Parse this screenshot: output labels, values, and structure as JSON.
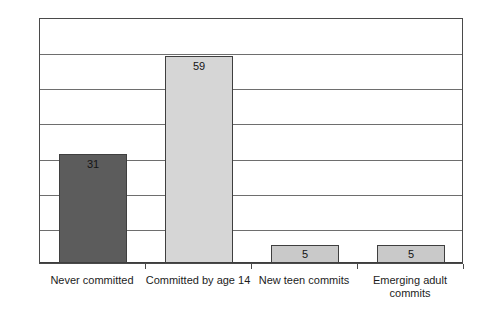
{
  "chart_data": {
    "type": "bar",
    "title": "",
    "subtitle": "",
    "xlabel": "",
    "ylabel": "",
    "categories": [
      "Never committed",
      "Committed by age 14",
      "New teen commits",
      "Emerging adult commits"
    ],
    "values": [
      31,
      59,
      5,
      5
    ],
    "data_labels": [
      "31",
      "59",
      "5",
      "5"
    ],
    "ylim": [
      0,
      70
    ],
    "ytick_step": 10,
    "ytick_labels": [
      "0",
      "10",
      "20",
      "30",
      "40",
      "50",
      "60",
      "70"
    ],
    "grid": true,
    "legend": "none",
    "bar_colors": [
      "#5c5c5c",
      "#d6d6d6",
      "#c9c9c9",
      "#c9c9c9"
    ],
    "bar_border_color": "#3f3f3f",
    "plot_border_color": "#4a4a4a",
    "gridline_color": "#6e6e6e",
    "background_color": "#ffffff",
    "text_color": "#1c1c1c"
  }
}
